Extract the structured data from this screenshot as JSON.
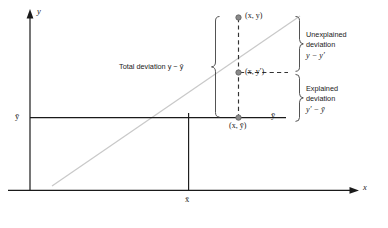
{
  "figure": {
    "background": "#ffffff",
    "axis_color": "#1a1a1a",
    "regression_line_color": "#c8c8c8",
    "dashed_line_color": "#3a3a3a",
    "point_color": "#808080",
    "brace_color": "#4a4a4a"
  },
  "axes": {
    "x_label": "x",
    "y_label": "y",
    "x_tick_label": "x̄",
    "y_tick_label": "ȳ",
    "y_mean_line_end_label": "ȳ"
  },
  "points": [
    {
      "id": "observed",
      "label": "(x, y)"
    },
    {
      "id": "predicted",
      "label": "(x, y′)"
    },
    {
      "id": "mean",
      "label": "(x, ȳ)"
    }
  ],
  "annotations": {
    "total": {
      "name": "Total deviation",
      "formula_lhs": "y",
      "formula_op": "−",
      "formula_rhs": "ȳ",
      "text": "Total deviation y − ȳ"
    },
    "unexplained": {
      "line1": "Unexplained",
      "line2": "deviation",
      "formula_lhs": "y",
      "formula_op": "−",
      "formula_rhs": "y′",
      "text": "Unexplained deviation y − y′"
    },
    "explained": {
      "line1": "Explained",
      "line2": "deviation",
      "formula_lhs": "y′",
      "formula_op": "−",
      "formula_rhs": "ȳ",
      "text": "Explained deviation y′ − ȳ"
    }
  }
}
